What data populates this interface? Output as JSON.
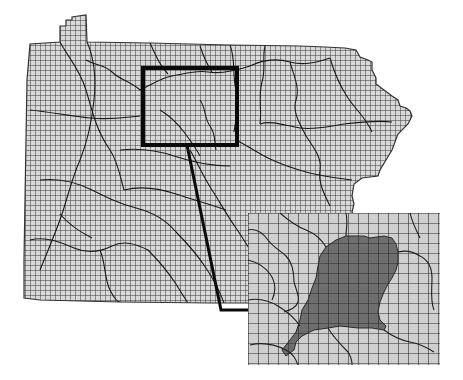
{
  "figure": {
    "has_text": false
  },
  "colors": {
    "background": "#ffffff",
    "map_fill": "#d9d9d9",
    "fine_grid": "#3a3a3a",
    "boundary": "#1a1a1a",
    "highlight_box": "#0a0a0a",
    "inset_fill": "#cfcfcf",
    "inset_grid": "#2a2a2a",
    "watershed_shade": "#6e6e6e"
  },
  "map": {
    "fine_grid_spacing_px": 5,
    "outline": [
      [
        60,
        42
      ],
      [
        60,
        26
      ],
      [
        66,
        26
      ],
      [
        66,
        20
      ],
      [
        72,
        20
      ],
      [
        72,
        17
      ],
      [
        86,
        15
      ],
      [
        87,
        42
      ],
      [
        150,
        43
      ],
      [
        230,
        45
      ],
      [
        300,
        46
      ],
      [
        325,
        47
      ],
      [
        345,
        48
      ],
      [
        356,
        50
      ],
      [
        360,
        57
      ],
      [
        368,
        60
      ],
      [
        372,
        62
      ],
      [
        372,
        70
      ],
      [
        376,
        78
      ],
      [
        376,
        84
      ],
      [
        384,
        90
      ],
      [
        392,
        96
      ],
      [
        398,
        100
      ],
      [
        400,
        106
      ],
      [
        406,
        108
      ],
      [
        410,
        111
      ],
      [
        412,
        116
      ],
      [
        408,
        124
      ],
      [
        398,
        134
      ],
      [
        392,
        150
      ],
      [
        386,
        160
      ],
      [
        380,
        170
      ],
      [
        378,
        176
      ],
      [
        362,
        178
      ],
      [
        354,
        184
      ],
      [
        352,
        196
      ],
      [
        354,
        204
      ],
      [
        352,
        212
      ],
      [
        356,
        220
      ],
      [
        358,
        226
      ],
      [
        346,
        230
      ],
      [
        340,
        234
      ],
      [
        316,
        236
      ],
      [
        300,
        238
      ],
      [
        290,
        240
      ],
      [
        280,
        262
      ],
      [
        270,
        290
      ],
      [
        262,
        300
      ],
      [
        248,
        303
      ],
      [
        210,
        303
      ],
      [
        120,
        302
      ],
      [
        40,
        300
      ],
      [
        24,
        298
      ],
      [
        24,
        260
      ],
      [
        25,
        200
      ],
      [
        26,
        140
      ],
      [
        27,
        80
      ],
      [
        30,
        44
      ],
      [
        60,
        42
      ]
    ],
    "watershed_boundaries": [
      "M60,42 C70,60 80,70 86,90 C92,110 96,130 110,150 C118,162 120,176 124,190",
      "M87,42 C95,60 96,80 94,100 C92,120 88,140 80,160 C72,178 68,196 62,214 C56,232 48,250 40,270",
      "M30,110 C50,112 70,116 90,118 C110,120 120,118 140,116",
      "M86,60 C96,66 104,64 112,72 C120,80 132,82 140,90",
      "M140,90 C150,86 160,78 172,76 C184,74 196,70 208,72 C220,74 232,72 250,66",
      "M150,43 C156,56 160,66 168,74",
      "M200,46 C204,58 208,66 212,72",
      "M230,45 C236,60 232,74 236,90 C240,104 236,118 234,132",
      "M250,66 C262,60 276,58 290,62 C304,66 318,62 330,58",
      "M265,46 C262,58 266,70 262,82 C258,96 262,110 260,124",
      "M290,62 C294,76 300,88 296,100 C292,112 300,124 306,136",
      "M330,58 C334,72 340,86 348,98 C356,110 366,118 372,132",
      "M260,124 C272,120 286,126 300,128 C316,130 330,126 344,124 C360,122 376,120 392,122",
      "M306,136 C314,148 322,158 320,170 C318,182 324,194 330,206",
      "M236,140 C248,146 256,152 268,158 C280,164 292,168 306,172 C320,176 336,178 352,180",
      "M190,150 C198,164 204,178 212,190 C220,202 226,214 236,228",
      "M120,150 C138,148 156,150 174,156 C192,162 210,166 230,166",
      "M124,190 C140,186 158,188 176,194 C194,200 210,204 226,210",
      "M40,180 C58,178 76,182 92,190 C108,198 120,204 136,208 C152,212 166,220 176,232",
      "M30,240 C46,236 60,242 74,248 C88,254 100,252 112,246 C124,240 136,244 148,250",
      "M100,250 C106,264 104,278 110,290 C114,298 118,302 120,302",
      "M148,250 C160,262 168,272 176,284 C182,294 186,300 188,303",
      "M176,232 C188,244 198,256 206,268 C214,280 220,292 224,303",
      "M236,228 C244,240 252,252 258,264 C264,276 268,288 270,298",
      "M60,214 C70,226 80,232 92,238",
      "M200,100 C206,108 204,118 210,126 C216,134 214,142 216,150",
      "M160,110 C170,116 178,124 184,132 C190,140 196,148 200,156"
    ]
  },
  "highlight_box": {
    "x": 143,
    "y": 68,
    "width": 94,
    "height": 77,
    "stroke_width": 4
  },
  "connector": {
    "points": [
      [
        187,
        145
      ],
      [
        221,
        310
      ],
      [
        250,
        310
      ]
    ],
    "stroke_width": 3
  },
  "inset": {
    "x": 248,
    "y": 213,
    "width": 192,
    "height": 152,
    "grid_spacing_px": 10,
    "watershed_polygon": [
      [
        326,
        247
      ],
      [
        336,
        240
      ],
      [
        346,
        236
      ],
      [
        364,
        236
      ],
      [
        370,
        238
      ],
      [
        384,
        236
      ],
      [
        392,
        238
      ],
      [
        396,
        244
      ],
      [
        398,
        252
      ],
      [
        398,
        262
      ],
      [
        396,
        270
      ],
      [
        392,
        278
      ],
      [
        388,
        284
      ],
      [
        384,
        292
      ],
      [
        380,
        302
      ],
      [
        378,
        312
      ],
      [
        380,
        320
      ],
      [
        386,
        326
      ],
      [
        384,
        330
      ],
      [
        372,
        328
      ],
      [
        358,
        328
      ],
      [
        340,
        326
      ],
      [
        328,
        328
      ],
      [
        314,
        330
      ],
      [
        302,
        336
      ],
      [
        296,
        342
      ],
      [
        294,
        350
      ],
      [
        286,
        356
      ],
      [
        282,
        350
      ],
      [
        290,
        340
      ],
      [
        296,
        332
      ],
      [
        300,
        320
      ],
      [
        302,
        310
      ],
      [
        308,
        300
      ],
      [
        312,
        288
      ],
      [
        316,
        278
      ],
      [
        318,
        266
      ],
      [
        320,
        256
      ]
    ],
    "boundaries": [
      "M248,230 C256,228 262,232 268,240 C274,248 280,250 286,256 C292,262 294,272 294,282",
      "M294,282 C296,290 300,296 298,302 C296,308 290,310 284,312",
      "M248,300 C258,298 268,300 278,306 C288,312 296,320 300,326",
      "M250,345 C262,342 274,344 286,350 C294,354 296,360 298,365",
      "M248,260 C256,262 264,266 270,274 C276,282 276,292 272,300",
      "M280,213 C288,220 296,226 306,230 C316,234 322,240 326,247",
      "M346,213 C348,222 346,230 346,236",
      "M398,252 C406,250 414,252 420,256 C428,260 432,268 432,278 C432,290 430,300 434,310",
      "M384,330 C392,336 400,340 410,342 C420,344 428,348 434,352",
      "M328,328 C334,338 342,346 348,352 C352,358 352,362 352,365",
      "M410,213 C412,222 416,230 420,238"
    ]
  }
}
